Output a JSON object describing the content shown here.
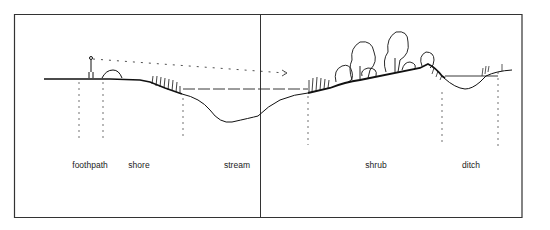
{
  "diagram": {
    "type": "landscape-cross-section",
    "zones": [
      {
        "id": "foothpath",
        "label": "foothpath",
        "x": 90
      },
      {
        "id": "shore",
        "label": "shore",
        "x": 139
      },
      {
        "id": "stream",
        "label": "stream",
        "x": 237
      },
      {
        "id": "shrub",
        "label": "shrub",
        "x": 375
      },
      {
        "id": "ditch",
        "label": "ditch",
        "x": 470
      }
    ],
    "colors": {
      "ink": "#1a1a1a",
      "paper": "#ffffff",
      "frame": "#333333"
    }
  }
}
